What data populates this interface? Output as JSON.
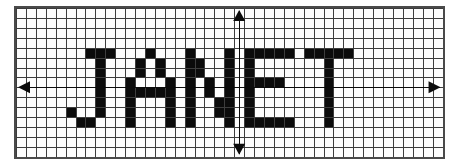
{
  "figure": {
    "title_text": "JANET",
    "background_color": "#ffffff",
    "panel_background_color": "#fdfdfd",
    "border_color": "#4a4a4a",
    "gridline_color": "#3d3d3d",
    "fill_color": "#0b0b0b",
    "axis_color": "#0b0b0b"
  },
  "grid": {
    "columns": 43,
    "rows": 15,
    "cell_size_px": 9.92,
    "origin_column": 22,
    "origin_row": 8,
    "show_gridlines": true
  },
  "axes": {
    "x_axis": {
      "label": "x-axis",
      "row": 7,
      "arrow_left": true,
      "arrow_right": true
    },
    "y_axis": {
      "label": "y-axis",
      "column": 22,
      "arrow_top": true,
      "arrow_bottom": true
    }
  },
  "chart_data": {
    "type": "heatmap",
    "xlabel": "",
    "ylabel": "",
    "grid": true,
    "legend": "none",
    "xlim": [
      0,
      43
    ],
    "ylim": [
      0,
      15
    ],
    "categories": [
      "J",
      "A",
      "N",
      "E",
      "T"
    ],
    "letters": [
      {
        "glyph": "J",
        "start_column": 5,
        "start_row": 4,
        "width": 5,
        "height": 8,
        "pattern": [
          "00111",
          "00010",
          "00010",
          "00010",
          "00010",
          "00010",
          "10010",
          "01100"
        ]
      },
      {
        "glyph": "A",
        "start_column": 11,
        "start_row": 4,
        "width": 5,
        "height": 8,
        "pattern": [
          "00100",
          "01010",
          "01010",
          "10001",
          "11111",
          "10001",
          "10001",
          "10001"
        ]
      },
      {
        "glyph": "N",
        "start_column": 17,
        "start_row": 4,
        "width": 5,
        "height": 8,
        "pattern": [
          "10001",
          "11001",
          "11001",
          "10101",
          "10101",
          "10011",
          "10011",
          "10001"
        ]
      },
      {
        "glyph": "E",
        "start_column": 23,
        "start_row": 4,
        "width": 5,
        "height": 8,
        "pattern": [
          "11111",
          "10000",
          "10000",
          "11110",
          "10000",
          "10000",
          "10000",
          "11111"
        ]
      },
      {
        "glyph": "T",
        "start_column": 29,
        "start_row": 4,
        "width": 5,
        "height": 8,
        "pattern": [
          "11111",
          "00100",
          "00100",
          "00100",
          "00100",
          "00100",
          "00100",
          "00100"
        ]
      }
    ]
  }
}
